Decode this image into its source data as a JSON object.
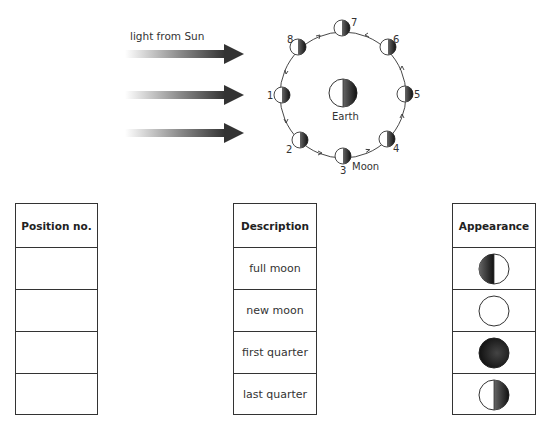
{
  "diagram": {
    "light_label": "light from Sun",
    "earth_label": "Earth",
    "moon_label": "Moon",
    "positions": [
      "1",
      "2",
      "3",
      "4",
      "5",
      "6",
      "7",
      "8"
    ],
    "colors": {
      "dark": "#222222",
      "light": "#ffffff",
      "line": "#333333"
    }
  },
  "tables": {
    "position": {
      "header": "Position no.",
      "rows": [
        "",
        "",
        "",
        ""
      ]
    },
    "description": {
      "header": "Description",
      "rows": [
        "full moon",
        "new moon",
        "first quarter",
        "last quarter"
      ]
    },
    "appearance": {
      "header": "Appearance",
      "rows": [
        "left-half-dark",
        "all-light",
        "all-dark",
        "right-half-dark"
      ]
    }
  }
}
